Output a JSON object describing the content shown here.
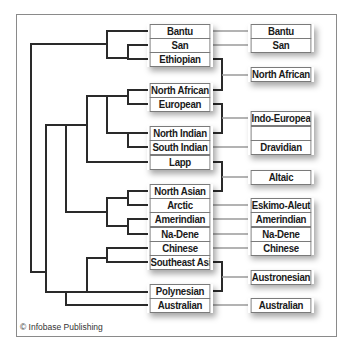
{
  "credit": "© Infobase Publishing",
  "colors": {
    "tree_line": "#2a2a2a",
    "connector_line": "#9a9a9a",
    "box_border": "#7a7a7a",
    "frame": "#8a8a8a"
  },
  "populations": [
    {
      "label": "Bantu",
      "y": 24
    },
    {
      "label": "San",
      "y": 38
    },
    {
      "label": "Ethiopian",
      "y": 52
    },
    {
      "label": "North African",
      "y": 83
    },
    {
      "label": "European",
      "y": 97
    },
    {
      "label": "North Indian",
      "y": 126
    },
    {
      "label": "South Indian",
      "y": 140
    },
    {
      "label": "Lapp",
      "y": 155
    },
    {
      "label": "North Asian",
      "y": 184
    },
    {
      "label": "Arctic",
      "y": 198
    },
    {
      "label": "Amerindian",
      "y": 212
    },
    {
      "label": "Na-Dene",
      "y": 227
    },
    {
      "label": "Chinese",
      "y": 241
    },
    {
      "label": "Southeast Asian",
      "y": 255
    },
    {
      "label": "Polynesian",
      "y": 284
    },
    {
      "label": "Australian",
      "y": 298
    }
  ],
  "language_families": [
    {
      "label": "Bantu",
      "y": 24
    },
    {
      "label": "San",
      "y": 38
    },
    {
      "label": "North African",
      "y": 67
    },
    {
      "label": "Indo-European",
      "y": 111
    },
    {
      "label": "",
      "y": 126
    },
    {
      "label": "Dravidian",
      "y": 140
    },
    {
      "label": "Altaic",
      "y": 170
    },
    {
      "label": "Eskimo-Aleut",
      "y": 198
    },
    {
      "label": "Amerindian",
      "y": 212
    },
    {
      "label": "Na-Dene",
      "y": 227
    },
    {
      "label": "Chinese",
      "y": 241
    },
    {
      "label": "Austronesian",
      "y": 270
    },
    {
      "label": "Australian",
      "y": 298
    }
  ]
}
